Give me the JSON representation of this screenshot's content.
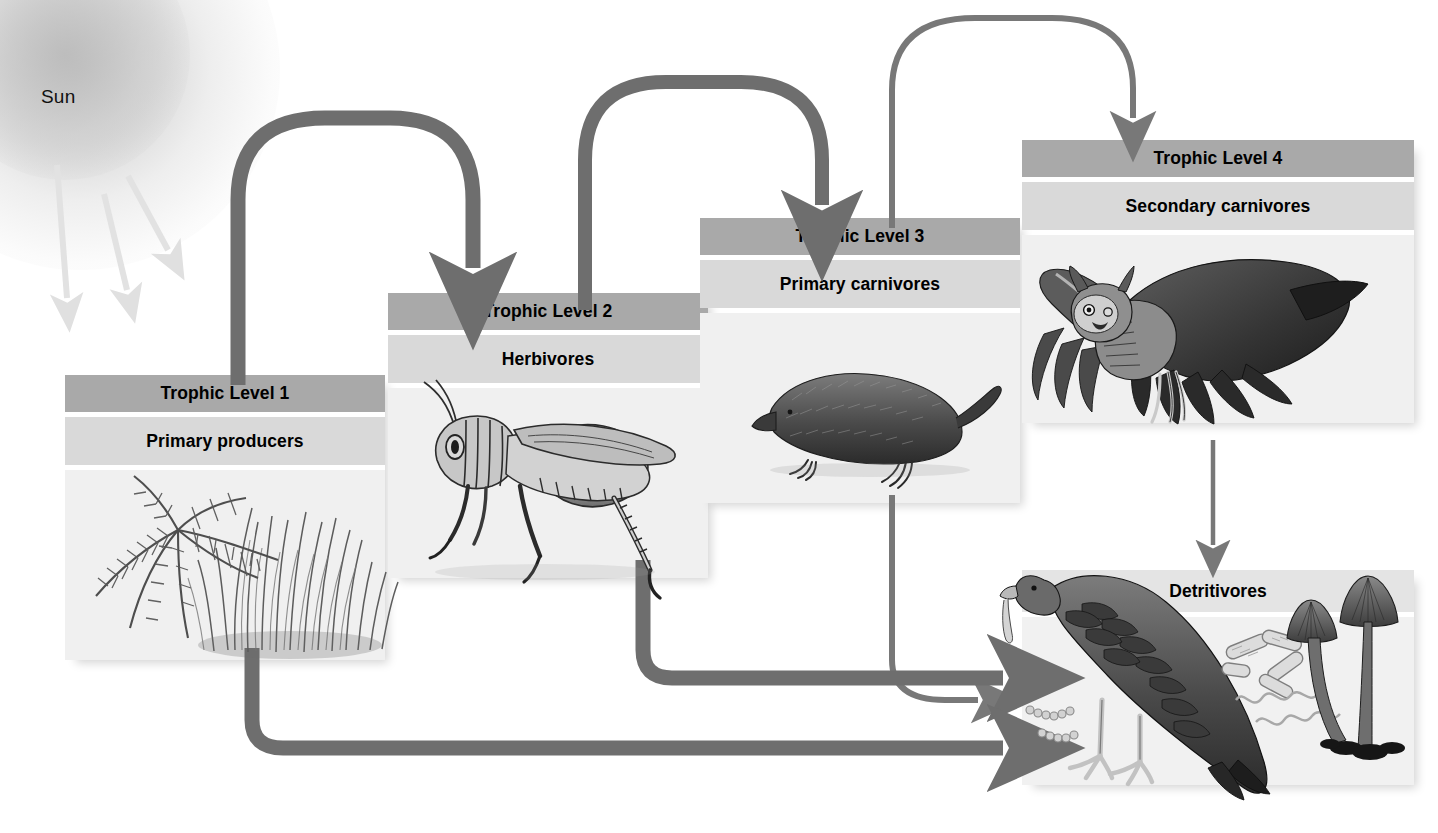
{
  "diagram": {
    "sun": {
      "label": "Sun",
      "ray_count": 3,
      "ray_color": "#e2e2e2"
    },
    "colors": {
      "header_band": "#a9a9a9",
      "subtitle_band": "#d9d9d9",
      "art_panel": "#f0f0f0",
      "arrow_thick": "#6e6e6e",
      "arrow_thin": "#787878",
      "text": "#000000",
      "background": "#ffffff"
    },
    "levels": [
      {
        "id": "level-1",
        "header": "Trophic Level 1",
        "subtitle": "Primary producers",
        "organism": "ferns-and-grass"
      },
      {
        "id": "level-2",
        "header": "Trophic Level 2",
        "subtitle": "Herbivores",
        "organism": "grasshopper"
      },
      {
        "id": "level-3",
        "header": "Trophic Level 3",
        "subtitle": "Primary carnivores",
        "organism": "shrew"
      },
      {
        "id": "level-4",
        "header": "Trophic Level 4",
        "subtitle": "Secondary carnivores",
        "organism": "great-horned-owl"
      }
    ],
    "detritivores": {
      "header": "Detritivores",
      "organisms": "vulture-bacteria-mushrooms"
    },
    "flows": [
      {
        "from": "Trophic Level 1",
        "to": "Trophic Level 2",
        "style": "thick-arch"
      },
      {
        "from": "Trophic Level 2",
        "to": "Trophic Level 3",
        "style": "thick-arch"
      },
      {
        "from": "Trophic Level 3",
        "to": "Trophic Level 4",
        "style": "thin-arch"
      },
      {
        "from": "Trophic Level 1",
        "to": "Detritivores",
        "style": "thick-elbow"
      },
      {
        "from": "Trophic Level 2",
        "to": "Detritivores",
        "style": "thick-elbow"
      },
      {
        "from": "Trophic Level 3",
        "to": "Detritivores",
        "style": "thin-elbow"
      },
      {
        "from": "Trophic Level 4",
        "to": "Detritivores",
        "style": "thin-straight-down"
      },
      {
        "from": "Sun",
        "to": "Trophic Level 1",
        "style": "light-rays"
      }
    ]
  }
}
